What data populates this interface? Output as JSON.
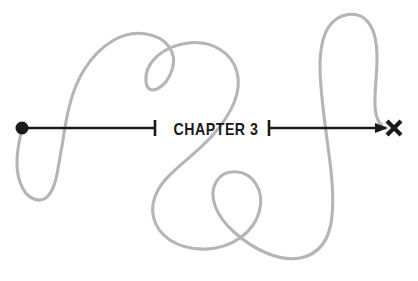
{
  "figure": {
    "kind": "chapter-divider-illustration",
    "width": 418,
    "height": 281,
    "background_color": "#ffffff",
    "title": "CHAPTER 3"
  },
  "label": {
    "text": "CHAPTER 3",
    "chapter_word": "CHAPTER",
    "chapter_number": "3",
    "color": "#1a1a1a",
    "center_x": 216,
    "baseline_y": 135
  },
  "colors": {
    "ink": "#1a1a1a",
    "squiggle": "#b5b5b5",
    "paper": "#ffffff"
  },
  "markers": {
    "start": {
      "name": "start-dot",
      "shape": "filled-circle",
      "cx": 22,
      "cy": 128,
      "r": 6.5,
      "color": "#1a1a1a"
    },
    "end": {
      "name": "end-x-mark",
      "shape": "x-cross",
      "cx": 394,
      "cy": 128,
      "size": 14,
      "color": "#1a1a1a"
    }
  },
  "rules": {
    "stroke_width": 2.6,
    "baseline_y": 128,
    "left_segment": {
      "x1": 26,
      "x2": 155
    },
    "right_segment": {
      "x1": 269,
      "x2": 386
    },
    "left_tick": {
      "x": 155,
      "y1": 120,
      "y2": 136
    },
    "right_tick": {
      "x": 269,
      "y1": 120,
      "y2": 136
    },
    "arrowhead": {
      "tip_x": 388,
      "tip_y": 128,
      "length": 13,
      "half_height": 5
    }
  },
  "squiggle": {
    "name": "winding-path",
    "color": "#b5b5b5",
    "stroke_width": 3.1,
    "description": "continuous hand-drawn meandering line weaving around the chapter rule",
    "path": "M 22 128 C 18 146 14 166 20 182 C 26 200 40 204 48 196 C 57 186 58 166 62 146 C 66 120 70 92 84 70 C 100 44 124 30 146 34 C 166 37 178 52 172 70 C 166 88 148 98 146 82 C 144 62 164 46 188 43 C 212 40 232 53 237 72 C 243 95 228 118 212 136 C 192 158 168 172 158 190 C 148 208 152 228 170 240 C 190 253 220 252 240 238 C 260 224 266 200 256 184 C 246 168 224 168 216 182 C 208 196 216 216 234 232 C 254 250 280 262 300 258 C 320 254 330 238 332 216 C 335 186 328 150 324 116 C 320 82 316 48 328 28 C 338 12 358 10 368 22 C 378 34 378 56 376 80 C 374 104 374 118 382 126"
  }
}
